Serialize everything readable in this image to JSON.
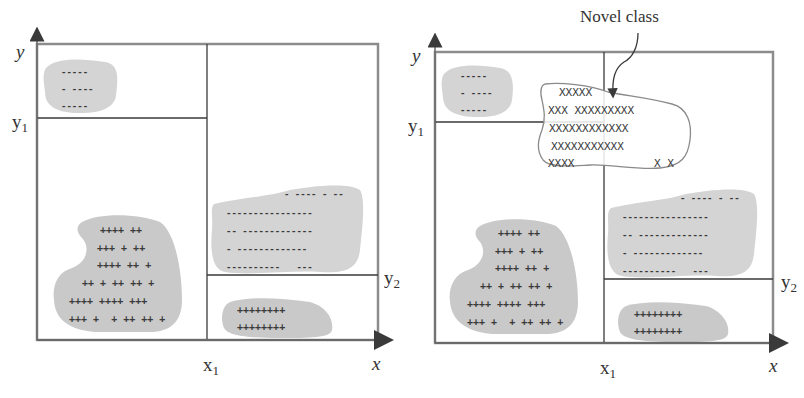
{
  "figure": {
    "colors": {
      "frame": "#8c8c8c",
      "divider": "#3a3a3a",
      "blob": "#d2d2d2",
      "marker": "#3a3a3a",
      "novel_outline": "#8a8a8a",
      "text": "#333333"
    }
  },
  "left_panel": {
    "y_axis_label": "y",
    "x_axis_label": "x",
    "y1_label": "y",
    "y1_sub": "1",
    "y2_label": "y",
    "y2_sub": "2",
    "x1_label": "x",
    "x1_sub": "1",
    "clusters": [
      {
        "name": "top-left-minus-cluster",
        "rows": [
          "-----",
          "- ----",
          "-----"
        ]
      },
      {
        "name": "bottom-left-plus-cluster",
        "rows": [
          "++++ ++",
          "+++ + ++",
          "++++ ++ +",
          "++ + ++ ++ +",
          "++++ ++++ +++",
          "+++ +  + ++ ++ +"
        ]
      },
      {
        "name": "right-middle-minus-cluster",
        "rows": [
          "- ---- - --",
          "----------------",
          "-- -------------",
          "- -------------",
          "----------   ---"
        ]
      },
      {
        "name": "bottom-right-plus-cluster",
        "rows": [
          "++++++++",
          "++++++++"
        ]
      }
    ]
  },
  "right_panel": {
    "y_axis_label": "y",
    "x_axis_label": "x",
    "y1_label": "y",
    "y1_sub": "1",
    "y2_label": "y",
    "y2_sub": "2",
    "x1_label": "x",
    "x1_sub": "1",
    "novel_class_label": "Novel class",
    "novel_rows": [
      "XXXXX",
      "XXX XXXXXXXXX",
      "XXXXXXXXXXXX",
      "XXXXXXXXXXX",
      "XXXX            X X"
    ],
    "clusters": [
      {
        "name": "top-left-minus-cluster",
        "rows": [
          "-----",
          "- ----",
          "-----"
        ]
      },
      {
        "name": "bottom-left-plus-cluster",
        "rows": [
          "++++ ++",
          "+++ + ++",
          "++++ ++ +",
          "++ + ++ ++ +",
          "++++ ++++ +++",
          "+++ +  + ++ ++ +"
        ]
      },
      {
        "name": "right-middle-minus-cluster",
        "rows": [
          "- ---- - --",
          "----------------",
          "-- -------------",
          "- -------------",
          "----------   ---"
        ]
      },
      {
        "name": "bottom-right-plus-cluster",
        "rows": [
          "++++++++",
          "++++++++"
        ]
      }
    ]
  }
}
